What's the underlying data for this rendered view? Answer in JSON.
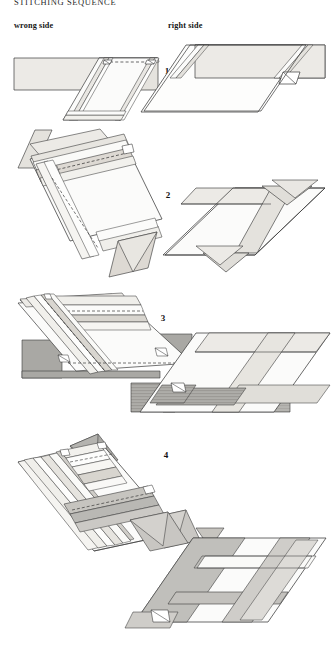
{
  "document": {
    "title": "STITCHING SEQUENCE",
    "type": "sewing-instruction-diagram",
    "background_color": "#ffffff",
    "ink_color": "#1a1a1a"
  },
  "columns": {
    "left_label": "wrong side",
    "right_label": "right side"
  },
  "steps": [
    {
      "number": "1"
    },
    {
      "number": "2"
    },
    {
      "number": "3"
    },
    {
      "number": "4"
    }
  ],
  "palette": {
    "outline": "#2f2f2f",
    "fabric_light": "#eceae6",
    "fabric_pale": "#f4f3f0",
    "fabric_white": "#fbfbfa",
    "fabric_mid": "#d6d4cf",
    "fabric_gray": "#a9a8a4",
    "fabric_dark": "#8d8c88",
    "seam_dashed": "#3a3a3a",
    "seam_solid": "#4a4a4a"
  }
}
